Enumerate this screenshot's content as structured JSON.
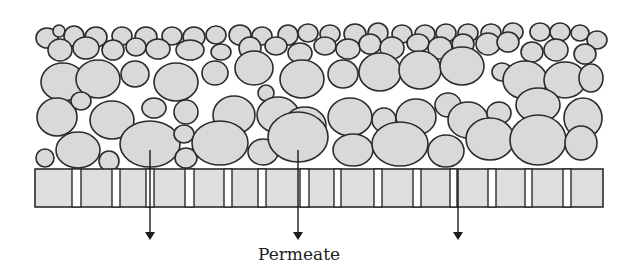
{
  "label": "Permeate",
  "colors": {
    "particle_fill": "#d9d9d9",
    "outline": "#2b2b2b",
    "membrane_fill": "#dedede",
    "background": "#ffffff"
  },
  "membrane": {
    "x": 35,
    "y": 169,
    "width": 568,
    "height": 38,
    "pores": [
      [
        72,
        9
      ],
      [
        112,
        8
      ],
      [
        146,
        8
      ],
      [
        185,
        9
      ],
      [
        224,
        8
      ],
      [
        258,
        8
      ],
      [
        300,
        9
      ],
      [
        334,
        7
      ],
      [
        374,
        8
      ],
      [
        413,
        8
      ],
      [
        450,
        7
      ],
      [
        488,
        8
      ],
      [
        525,
        7
      ],
      [
        563,
        8
      ]
    ]
  },
  "arrows": [
    {
      "x": 150,
      "y1": 150,
      "y2": 240
    },
    {
      "x": 298,
      "y1": 150,
      "y2": 240
    },
    {
      "x": 458,
      "y1": 169,
      "y2": 240
    }
  ],
  "particles": [
    [
      47,
      38,
      11,
      10
    ],
    [
      59,
      31,
      6,
      6
    ],
    [
      74,
      36,
      10,
      10
    ],
    [
      96,
      37,
      11,
      10
    ],
    [
      122,
      36,
      10,
      9
    ],
    [
      146,
      37,
      11,
      10
    ],
    [
      172,
      36,
      10,
      9
    ],
    [
      194,
      37,
      11,
      10
    ],
    [
      216,
      35,
      10,
      9
    ],
    [
      240,
      35,
      11,
      10
    ],
    [
      262,
      36,
      10,
      9
    ],
    [
      288,
      35,
      10,
      10
    ],
    [
      308,
      33,
      10,
      9
    ],
    [
      330,
      34,
      10,
      9
    ],
    [
      355,
      34,
      11,
      10
    ],
    [
      378,
      33,
      10,
      10
    ],
    [
      402,
      34,
      10,
      9
    ],
    [
      425,
      34,
      10,
      9
    ],
    [
      446,
      33,
      10,
      9
    ],
    [
      468,
      33,
      10,
      9
    ],
    [
      491,
      33,
      10,
      9
    ],
    [
      513,
      32,
      10,
      9
    ],
    [
      540,
      32,
      10,
      9
    ],
    [
      560,
      32,
      10,
      9
    ],
    [
      580,
      33,
      9,
      8
    ],
    [
      597,
      40,
      10,
      9
    ],
    [
      60,
      50,
      12,
      11
    ],
    [
      86,
      48,
      13,
      11
    ],
    [
      113,
      50,
      11,
      10
    ],
    [
      136,
      47,
      10,
      9
    ],
    [
      158,
      49,
      12,
      10
    ],
    [
      190,
      50,
      14,
      10
    ],
    [
      221,
      52,
      10,
      8
    ],
    [
      250,
      48,
      11,
      11
    ],
    [
      276,
      46,
      11,
      9
    ],
    [
      300,
      53,
      12,
      10
    ],
    [
      325,
      46,
      11,
      9
    ],
    [
      348,
      49,
      12,
      10
    ],
    [
      370,
      44,
      11,
      10
    ],
    [
      392,
      48,
      12,
      11
    ],
    [
      418,
      43,
      11,
      9
    ],
    [
      440,
      48,
      12,
      11
    ],
    [
      463,
      44,
      11,
      10
    ],
    [
      488,
      44,
      12,
      11
    ],
    [
      508,
      42,
      11,
      10
    ],
    [
      532,
      52,
      11,
      10
    ],
    [
      556,
      50,
      12,
      11
    ],
    [
      585,
      54,
      11,
      10
    ],
    [
      63,
      82,
      22,
      19
    ],
    [
      98,
      79,
      22,
      19
    ],
    [
      135,
      74,
      14,
      13
    ],
    [
      176,
      82,
      22,
      19
    ],
    [
      215,
      73,
      13,
      12
    ],
    [
      254,
      68,
      19,
      17
    ],
    [
      302,
      79,
      22,
      19
    ],
    [
      343,
      74,
      15,
      14
    ],
    [
      380,
      72,
      21,
      19
    ],
    [
      420,
      70,
      21,
      19
    ],
    [
      462,
      66,
      22,
      19
    ],
    [
      502,
      72,
      10,
      9
    ],
    [
      525,
      80,
      22,
      19
    ],
    [
      565,
      80,
      21,
      18
    ],
    [
      591,
      78,
      12,
      14
    ],
    [
      57,
      117,
      20,
      19
    ],
    [
      81,
      101,
      10,
      9
    ],
    [
      112,
      120,
      22,
      19
    ],
    [
      154,
      108,
      12,
      10
    ],
    [
      186,
      112,
      12,
      12
    ],
    [
      234,
      115,
      21,
      19
    ],
    [
      266,
      93,
      8,
      8
    ],
    [
      278,
      115,
      21,
      18
    ],
    [
      305,
      125,
      21,
      18
    ],
    [
      350,
      117,
      22,
      19
    ],
    [
      384,
      120,
      12,
      12
    ],
    [
      416,
      117,
      20,
      18
    ],
    [
      448,
      105,
      13,
      12
    ],
    [
      468,
      120,
      20,
      18
    ],
    [
      499,
      113,
      12,
      11
    ],
    [
      538,
      105,
      22,
      17
    ],
    [
      583,
      118,
      19,
      20
    ],
    [
      45,
      158,
      9,
      9
    ],
    [
      78,
      150,
      22,
      18
    ],
    [
      109,
      161,
      10,
      10
    ],
    [
      150,
      144,
      30,
      23
    ],
    [
      184,
      134,
      10,
      9
    ],
    [
      186,
      158,
      11,
      10
    ],
    [
      220,
      143,
      28,
      22
    ],
    [
      263,
      152,
      15,
      13
    ],
    [
      298,
      137,
      30,
      25
    ],
    [
      353,
      150,
      20,
      16
    ],
    [
      400,
      144,
      28,
      22
    ],
    [
      446,
      151,
      18,
      16
    ],
    [
      490,
      139,
      24,
      21
    ],
    [
      538,
      140,
      28,
      25
    ],
    [
      581,
      143,
      16,
      17
    ]
  ]
}
